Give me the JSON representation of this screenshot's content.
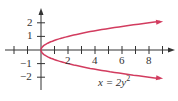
{
  "chart_data": {
    "type": "line",
    "title": "",
    "xlabel": "",
    "ylabel": "",
    "equation": "x = 2y^2",
    "equation_label": {
      "prefix": "x = 2y",
      "exponent": "2"
    },
    "xlim": [
      -3,
      9.5
    ],
    "ylim": [
      -2.9,
      3
    ],
    "x_ticks": [
      -2,
      -1,
      1,
      2,
      3,
      4,
      5,
      6,
      7,
      8,
      9
    ],
    "x_tick_labels": [
      "2",
      "4",
      "6",
      "8"
    ],
    "y_ticks": [
      -2,
      -1,
      1,
      2
    ],
    "y_tick_labels": [
      "2",
      "1",
      "−1",
      "−2"
    ],
    "grid": false,
    "series": [
      {
        "name": "x = 2y^2",
        "color": "#d23c5f",
        "points": [
          {
            "x": 8.82,
            "y": 2.1
          },
          {
            "x": 8,
            "y": 2
          },
          {
            "x": 4.5,
            "y": 1.5
          },
          {
            "x": 2,
            "y": 1
          },
          {
            "x": 0.5,
            "y": 0.5
          },
          {
            "x": 0,
            "y": 0
          },
          {
            "x": 0.5,
            "y": -0.5
          },
          {
            "x": 2,
            "y": -1
          },
          {
            "x": 4.5,
            "y": -1.5
          },
          {
            "x": 8,
            "y": -2
          },
          {
            "x": 8.82,
            "y": -2.1
          }
        ]
      }
    ]
  },
  "colors": {
    "axis": "#333333",
    "curve": "#d23c5f"
  }
}
